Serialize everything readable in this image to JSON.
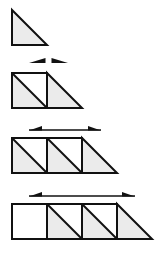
{
  "diagram": {
    "colors": {
      "stroke": "#111111",
      "fill": "#ebebeb",
      "background": "#ffffff"
    },
    "unit": 35,
    "figures": [
      {
        "index": 1,
        "empty_squares": 0,
        "split_squares": 0,
        "has_triangle": true,
        "arrow": null
      },
      {
        "index": 2,
        "empty_squares": 0,
        "split_squares": 1,
        "has_triangle": true,
        "arrow": {
          "style": "split",
          "x1": 29,
          "x2": 68
        }
      },
      {
        "index": 3,
        "empty_squares": 0,
        "split_squares": 2,
        "has_triangle": true,
        "arrow": {
          "style": "line",
          "x1": 29,
          "x2": 101
        }
      },
      {
        "index": 4,
        "empty_squares": 1,
        "split_squares": 2,
        "has_triangle": true,
        "arrow": {
          "style": "line",
          "x1": 29,
          "x2": 135
        }
      }
    ]
  }
}
